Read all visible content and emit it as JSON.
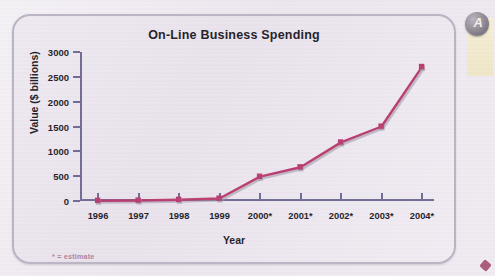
{
  "figure": {
    "title": "On-Line Business Spending",
    "footnote": "* = estimate"
  },
  "axes": {
    "x_title": "Year",
    "y_title": "Value ($ billions)"
  },
  "chart_data": {
    "type": "line",
    "title": "On-Line Business Spending",
    "xlabel": "Year",
    "ylabel": "Value ($ billions)",
    "categories": [
      "1996",
      "1997",
      "1998",
      "1999",
      "2000*",
      "2001*",
      "2002*",
      "2003*",
      "2004*"
    ],
    "values": [
      5,
      10,
      25,
      50,
      490,
      680,
      1180,
      1500,
      2700
    ],
    "ylim": [
      0,
      3000
    ],
    "ytick_labels": [
      "0",
      "500",
      "1000",
      "1500",
      "2000",
      "2500",
      "3000"
    ],
    "ytick_values": [
      0,
      500,
      1000,
      1500,
      2000,
      2500,
      3000
    ],
    "grid": false,
    "legend": "none",
    "annotations": [
      "* = estimate"
    ],
    "series_color": "#b83a6e",
    "marker": "square",
    "marker_color": "#b83a6e"
  },
  "colors": {
    "accent": "#b83a6e",
    "axis": "#6f6a93",
    "text": "#1d1b26",
    "panel": "#ece6ee"
  },
  "edge_decoration": {
    "glyph": "A"
  }
}
